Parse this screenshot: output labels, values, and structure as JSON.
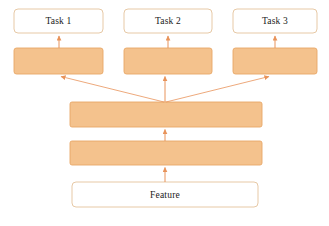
{
  "diagram": {
    "colors": {
      "block_fill": "#f4c28d",
      "block_stroke": "#e8a766",
      "box_fill": "#ffffff",
      "box_stroke": "#e7c9a6",
      "arrow": "#e8935a",
      "text": "#1a1a1a",
      "background": "#ffffff"
    },
    "nodes": [
      {
        "id": "task1",
        "label": "Task 1",
        "type": "outline-box",
        "x": 14,
        "y": 9,
        "w": 89,
        "h": 24
      },
      {
        "id": "task2",
        "label": "Task 2",
        "type": "outline-box",
        "x": 124,
        "y": 9,
        "w": 88,
        "h": 24
      },
      {
        "id": "task3",
        "label": "Task 3",
        "type": "outline-box",
        "x": 233,
        "y": 9,
        "w": 84,
        "h": 24
      },
      {
        "id": "head1",
        "label": "",
        "type": "filled-block",
        "x": 14,
        "y": 48,
        "w": 89,
        "h": 26
      },
      {
        "id": "head2",
        "label": "",
        "type": "filled-block",
        "x": 124,
        "y": 48,
        "w": 88,
        "h": 26
      },
      {
        "id": "head3",
        "label": "",
        "type": "filled-block",
        "x": 233,
        "y": 48,
        "w": 84,
        "h": 26
      },
      {
        "id": "shared2",
        "label": "",
        "type": "filled-block",
        "x": 70,
        "y": 102,
        "w": 192,
        "h": 25
      },
      {
        "id": "shared1",
        "label": "",
        "type": "filled-block",
        "x": 70,
        "y": 141,
        "w": 192,
        "h": 24
      },
      {
        "id": "feature",
        "label": "Feature",
        "type": "outline-box",
        "x": 72,
        "y": 182,
        "w": 186,
        "h": 25
      }
    ],
    "edges": [
      {
        "id": "feature-to-shared1",
        "from": "feature",
        "to": "shared1",
        "kind": "vertical-arrow"
      },
      {
        "id": "shared1-to-shared2",
        "from": "shared1",
        "to": "shared2",
        "kind": "vertical-arrow"
      },
      {
        "id": "shared2-to-head1",
        "from": "shared2",
        "to": "head1",
        "kind": "diagonal-arrow"
      },
      {
        "id": "shared2-to-head2",
        "from": "shared2",
        "to": "head2",
        "kind": "vertical-arrow"
      },
      {
        "id": "shared2-to-head3",
        "from": "shared2",
        "to": "head3",
        "kind": "diagonal-arrow"
      },
      {
        "id": "head1-to-task1",
        "from": "head1",
        "to": "task1",
        "kind": "vertical-arrow"
      },
      {
        "id": "head2-to-task2",
        "from": "head2",
        "to": "task2",
        "kind": "vertical-arrow"
      },
      {
        "id": "head3-to-task3",
        "from": "head3",
        "to": "task3",
        "kind": "vertical-arrow"
      }
    ]
  }
}
